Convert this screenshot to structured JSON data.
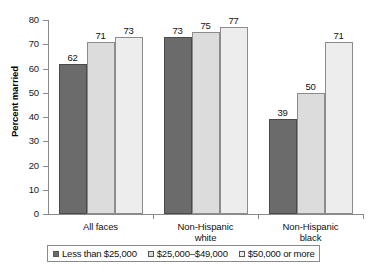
{
  "chart_data": {
    "type": "bar",
    "title": "",
    "subtitle": "",
    "xlabel": "",
    "ylabel": "Percent married",
    "ylim": [
      0,
      80
    ],
    "ytick_step": 10,
    "yticks": [
      "80",
      "70",
      "60",
      "50",
      "40",
      "30",
      "20",
      "10",
      "0"
    ],
    "grid": false,
    "legend_position": "bottom",
    "categories": [
      "All faces",
      "Non-Hispanic white",
      "Non-Hispanic black"
    ],
    "category_lines": [
      [
        "All faces"
      ],
      [
        "Non-Hispanic",
        "white"
      ],
      [
        "Non-Hispanic",
        "black"
      ]
    ],
    "series": [
      {
        "name": "Less than $25,000",
        "color": "#6b6b6b",
        "values": [
          62,
          71,
          73
        ],
        "value_labels": [
          "62",
          "73",
          "39"
        ]
      },
      {
        "name": "$25,000–$49,000",
        "color": "#dcdcdc",
        "values": [
          71,
          75,
          50
        ],
        "value_labels": [
          "71",
          "75",
          "50"
        ]
      },
      {
        "name": "$50,000 or more",
        "color": "#ededed",
        "values": [
          73,
          77,
          71
        ],
        "value_labels": [
          "73",
          "77",
          "71"
        ]
      }
    ],
    "groups": [
      {
        "label": "All faces",
        "bars": [
          {
            "series": "Less than $25,000",
            "value": 62,
            "label": "62"
          },
          {
            "series": "$25,000–$49,000",
            "value": 71,
            "label": "71"
          },
          {
            "series": "$50,000 or more",
            "value": 73,
            "label": "73"
          }
        ]
      },
      {
        "label": "Non-Hispanic white",
        "bars": [
          {
            "series": "Less than $25,000",
            "value": 73,
            "label": "73"
          },
          {
            "series": "$25,000–$49,000",
            "value": 75,
            "label": "75"
          },
          {
            "series": "$50,000 or more",
            "value": 77,
            "label": "77"
          }
        ]
      },
      {
        "label": "Non-Hispanic black",
        "bars": [
          {
            "series": "Less than $25,000",
            "value": 39,
            "label": "39"
          },
          {
            "series": "$25,000–$49,000",
            "value": 50,
            "label": "50"
          },
          {
            "series": "$50,000 or more",
            "value": 71,
            "label": "71"
          }
        ]
      }
    ]
  },
  "legend": {
    "items": [
      {
        "label": "Less than $25,000",
        "color": "#6b6b6b"
      },
      {
        "label": "$25,000–$49,000",
        "color": "#dcdcdc"
      },
      {
        "label": "$50,000 or more",
        "color": "#ededed"
      }
    ]
  },
  "axis": {
    "y_title": "Percent married"
  }
}
